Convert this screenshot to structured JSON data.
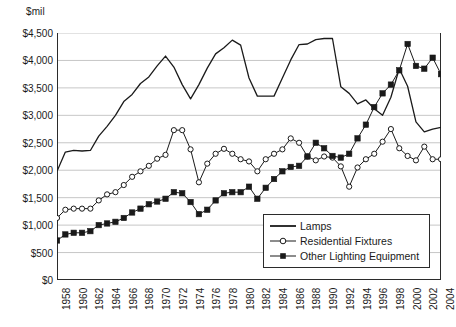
{
  "chart_data": {
    "type": "line",
    "title": "",
    "subtitle": "",
    "unit_label": "$mil",
    "xlabel": "",
    "ylabel": "$mil",
    "ylim": [
      0,
      4500
    ],
    "ytick_step": 500,
    "ytick_labels": [
      "$4,500",
      "$4,000",
      "$3,500",
      "$3,000",
      "$2,500",
      "$2,000",
      "$1,500",
      "$1,000",
      "$500",
      "$0"
    ],
    "ytick_values": [
      4500,
      4000,
      3500,
      3000,
      2500,
      2000,
      1500,
      1000,
      500,
      0
    ],
    "grid": "horizontal",
    "legend_position": "bottom-right",
    "xlim": [
      1958,
      2004
    ],
    "x": [
      1958,
      1959,
      1960,
      1961,
      1962,
      1963,
      1964,
      1965,
      1966,
      1967,
      1968,
      1969,
      1970,
      1971,
      1972,
      1973,
      1974,
      1975,
      1976,
      1977,
      1978,
      1979,
      1980,
      1981,
      1982,
      1983,
      1984,
      1985,
      1986,
      1987,
      1988,
      1989,
      1990,
      1991,
      1992,
      1993,
      1994,
      1995,
      1996,
      1997,
      1998,
      1999,
      2000,
      2001,
      2002,
      2003,
      2004
    ],
    "xtick_labels": [
      "1958",
      "1960",
      "1962",
      "1964",
      "1966",
      "1968",
      "1970",
      "1972",
      "1974",
      "1976",
      "1978",
      "1980",
      "1982",
      "1984",
      "1986",
      "1988",
      "1990",
      "1992",
      "1994",
      "1996",
      "1998",
      "2000",
      "2002",
      "2004"
    ],
    "xtick_values": [
      1958,
      1960,
      1962,
      1964,
      1966,
      1968,
      1970,
      1972,
      1974,
      1976,
      1978,
      1980,
      1982,
      1984,
      1986,
      1988,
      1990,
      1992,
      1994,
      1996,
      1998,
      2000,
      2002,
      2004
    ],
    "series": [
      {
        "name": "Lamps",
        "marker": "none",
        "color": "#1a1a1a",
        "values": [
          1980,
          2330,
          2360,
          2350,
          2360,
          2620,
          2800,
          3000,
          3250,
          3380,
          3580,
          3700,
          3900,
          4080,
          3880,
          3560,
          3300,
          3560,
          3860,
          4120,
          4230,
          4370,
          4280,
          3680,
          3350,
          3350,
          3350,
          3680,
          4010,
          4290,
          4300,
          4380,
          4400,
          4400,
          3520,
          3400,
          3210,
          3280,
          3120,
          3000,
          3330,
          3850,
          3530,
          2880,
          2700,
          2750,
          2780
        ]
      },
      {
        "name": "Residential Fixtures",
        "marker": "open-circle",
        "color": "#1a1a1a",
        "values": [
          1130,
          1280,
          1300,
          1300,
          1300,
          1450,
          1560,
          1600,
          1730,
          1880,
          1980,
          2080,
          2210,
          2280,
          2730,
          2730,
          2380,
          1780,
          2120,
          2300,
          2390,
          2300,
          2200,
          2160,
          1980,
          2200,
          2300,
          2380,
          2580,
          2500,
          2250,
          2180,
          2250,
          2230,
          2070,
          1700,
          2050,
          2200,
          2300,
          2520,
          2750,
          2400,
          2260,
          2180,
          2430,
          2200,
          2200
        ]
      },
      {
        "name": "Other Lighting Equipment",
        "marker": "filled-square",
        "color": "#1a1a1a",
        "values": [
          720,
          830,
          860,
          860,
          890,
          1000,
          1030,
          1060,
          1130,
          1230,
          1300,
          1380,
          1430,
          1480,
          1600,
          1580,
          1420,
          1200,
          1280,
          1450,
          1580,
          1600,
          1600,
          1700,
          1480,
          1680,
          1840,
          1980,
          2060,
          2080,
          2250,
          2500,
          2400,
          2260,
          2230,
          2300,
          2580,
          2830,
          3150,
          3400,
          3560,
          3820,
          4300,
          3900,
          3850,
          4050,
          3750
        ]
      }
    ]
  },
  "legend": {
    "items": [
      {
        "label": "Lamps",
        "marker": "none"
      },
      {
        "label": "Residential Fixtures",
        "marker": "open-circle"
      },
      {
        "label": "Other Lighting Equipment",
        "marker": "filled-square"
      }
    ]
  }
}
